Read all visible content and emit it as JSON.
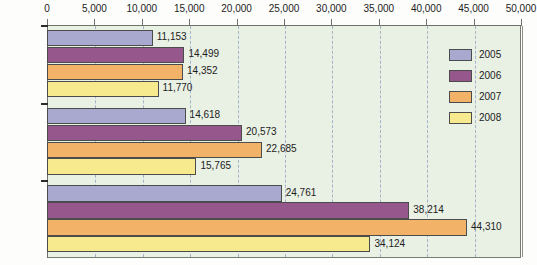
{
  "chart_data": {
    "type": "bar",
    "orientation": "horizontal",
    "title": "",
    "xlabel": "",
    "ylabel": "",
    "categories": [
      "Attacks",
      "Deaths",
      "Injuries"
    ],
    "series": [
      {
        "name": "2005",
        "color": "#a9a9cf",
        "values": [
          11153,
          14618,
          24761
        ],
        "labels": [
          "11,153",
          "14,618",
          "24,761"
        ]
      },
      {
        "name": "2006",
        "color": "#96588c",
        "values": [
          14499,
          20573,
          38214
        ],
        "labels": [
          "14,499",
          "20,573",
          "38,214"
        ]
      },
      {
        "name": "2007",
        "color": "#f2b268",
        "values": [
          14352,
          22685,
          44310
        ],
        "labels": [
          "14,352",
          "22,685",
          "44,310"
        ]
      },
      {
        "name": "2008",
        "color": "#f7e98d",
        "values": [
          11770,
          15765,
          34124
        ],
        "labels": [
          "11,770",
          "15,765",
          "34,124"
        ]
      }
    ],
    "xlim": [
      0,
      50000
    ],
    "xticks": [
      0,
      5000,
      10000,
      15000,
      20000,
      25000,
      30000,
      35000,
      40000,
      45000,
      50000
    ],
    "xtick_labels": [
      "0",
      "5,000",
      "10,000",
      "15,000",
      "20,000",
      "25,000",
      "30,000",
      "35,000",
      "40,000",
      "45,000",
      "50,000"
    ],
    "grid": true,
    "grid_style": "dashed-vertical",
    "legend_position": "top-right",
    "plot_background": "#e9f0e4",
    "axis_color": "#6e7268",
    "grid_color": "#9aa8c8"
  },
  "legend": {
    "entries": [
      {
        "label": "2005"
      },
      {
        "label": "2006"
      },
      {
        "label": "2007"
      },
      {
        "label": "2008"
      }
    ]
  }
}
